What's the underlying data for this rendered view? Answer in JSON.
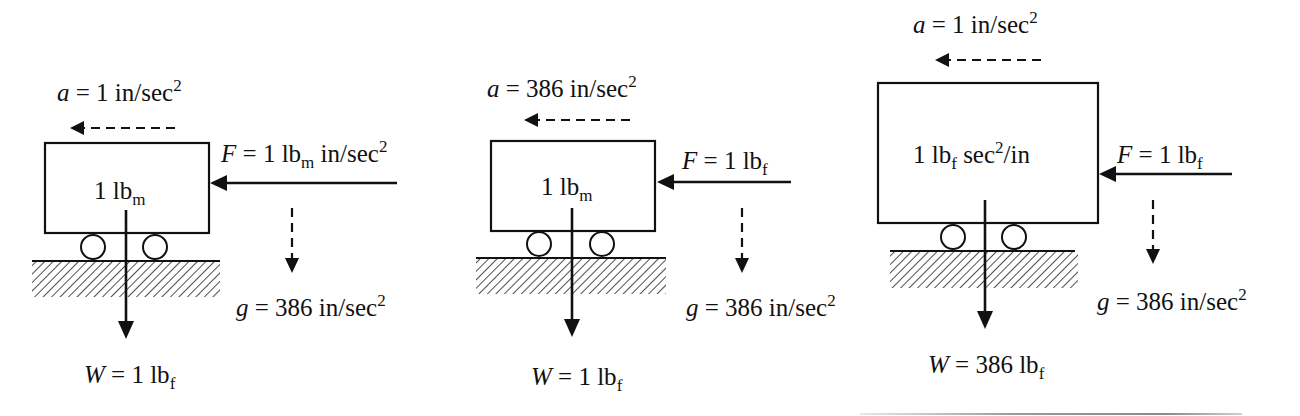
{
  "figure": {
    "colors": {
      "ink": "#111111",
      "background": "#ffffff"
    },
    "panels": [
      {
        "id": "panel-1",
        "mass_label": {
          "value": "1 lb",
          "sub": "m",
          "rest": ""
        },
        "acceleration": {
          "symbol": "a",
          "eq": " = 1 in/sec",
          "sup": "2",
          "direction": "left",
          "style": "dashed"
        },
        "force": {
          "symbol": "F",
          "eq": " = 1 lb",
          "sub": "m",
          "rest": " in/sec",
          "sup": "2",
          "direction": "left",
          "style": "solid"
        },
        "gravity": {
          "symbol": "g",
          "eq": " = 386 in/sec",
          "sup": "2",
          "direction": "down",
          "style": "dashed"
        },
        "weight": {
          "symbol": "W",
          "eq": " = 1 lb",
          "sub": "f",
          "direction": "down",
          "style": "solid"
        }
      },
      {
        "id": "panel-2",
        "mass_label": {
          "value": "1 lb",
          "sub": "m",
          "rest": ""
        },
        "acceleration": {
          "symbol": "a",
          "eq": " = 386 in/sec",
          "sup": "2",
          "direction": "left",
          "style": "dashed"
        },
        "force": {
          "symbol": "F",
          "eq": " = 1 lb",
          "sub": "f",
          "rest": "",
          "sup": "",
          "direction": "left",
          "style": "solid"
        },
        "gravity": {
          "symbol": "g",
          "eq": " = 386 in/sec",
          "sup": "2",
          "direction": "down",
          "style": "dashed"
        },
        "weight": {
          "symbol": "W",
          "eq": " = 1 lb",
          "sub": "f",
          "direction": "down",
          "style": "solid"
        }
      },
      {
        "id": "panel-3",
        "mass_label": {
          "value": "1 lb",
          "sub": "f",
          "rest": " sec",
          "sup": "2",
          "tail": "/in"
        },
        "acceleration": {
          "symbol": "a",
          "eq": " = 1 in/sec",
          "sup": "2",
          "direction": "left",
          "style": "dashed"
        },
        "force": {
          "symbol": "F",
          "eq": " = 1 lb",
          "sub": "f",
          "rest": "",
          "sup": "",
          "direction": "left",
          "style": "solid"
        },
        "gravity": {
          "symbol": "g",
          "eq": " = 386 in/sec",
          "sup": "2",
          "direction": "down",
          "style": "dashed"
        },
        "weight": {
          "symbol": "W",
          "eq": " = 386 lb",
          "sub": "f",
          "direction": "down",
          "style": "solid"
        }
      }
    ]
  }
}
